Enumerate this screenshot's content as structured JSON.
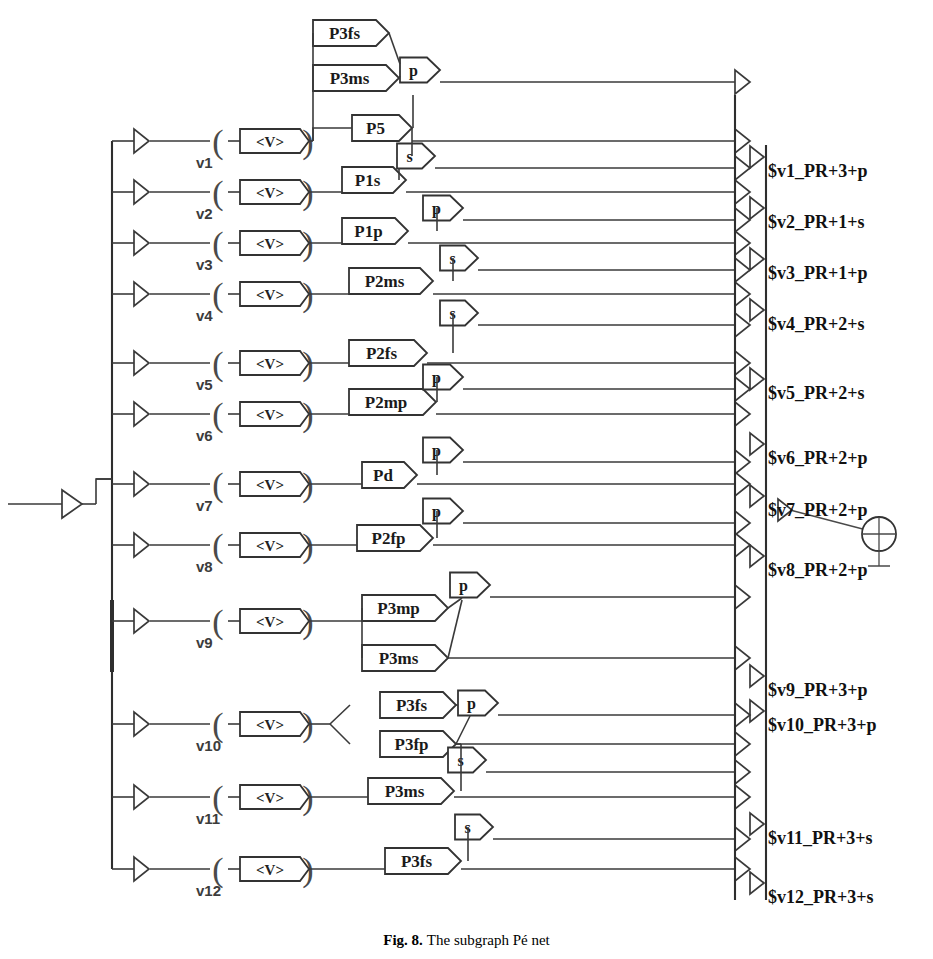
{
  "figure": {
    "caption_label": "Fig. 8.",
    "caption_text": "The subgraph Pé net",
    "value_box_label": "<V>"
  },
  "left_branches": [
    {
      "id": "v1",
      "label": "v1",
      "y": 141
    },
    {
      "id": "v2",
      "label": "v2",
      "y": 192
    },
    {
      "id": "v3",
      "label": "v3",
      "y": 243
    },
    {
      "id": "v4",
      "label": "v4",
      "y": 294
    },
    {
      "id": "v5",
      "label": "v5",
      "y": 363
    },
    {
      "id": "v6",
      "label": "v6",
      "y": 414
    },
    {
      "id": "v7",
      "label": "v7",
      "y": 484
    },
    {
      "id": "v8",
      "label": "v8",
      "y": 545
    },
    {
      "id": "v9",
      "label": "v9",
      "y": 621
    },
    {
      "id": "v10",
      "label": "v10",
      "y": 724
    },
    {
      "id": "v11",
      "label": "v11",
      "y": 797
    },
    {
      "id": "v12",
      "label": "v12",
      "y": 869
    }
  ],
  "place_boxes": [
    {
      "id": "p3fs_a",
      "label": "P3fs",
      "x": 313,
      "y": 33,
      "w": 63
    },
    {
      "id": "p3ms_a",
      "label": "P3ms",
      "x": 313,
      "y": 78,
      "w": 73
    },
    {
      "id": "p5",
      "label": "P5",
      "x": 352,
      "y": 128,
      "w": 47
    },
    {
      "id": "p1s",
      "label": "P1s",
      "x": 342,
      "y": 180,
      "w": 51
    },
    {
      "id": "p1p",
      "label": "P1p",
      "x": 342,
      "y": 231,
      "w": 53
    },
    {
      "id": "p2ms",
      "label": "P2ms",
      "x": 349,
      "y": 281,
      "w": 71
    },
    {
      "id": "p2fs",
      "label": "P2fs",
      "x": 349,
      "y": 353,
      "w": 65
    },
    {
      "id": "p2mp",
      "label": "P2mp",
      "x": 349,
      "y": 402,
      "w": 74
    },
    {
      "id": "pd",
      "label": "Pd",
      "x": 362,
      "y": 475,
      "w": 42
    },
    {
      "id": "p2fp",
      "label": "P2fp",
      "x": 357,
      "y": 538,
      "w": 63
    },
    {
      "id": "p3mp",
      "label": "P3mp",
      "x": 362,
      "y": 608,
      "w": 73
    },
    {
      "id": "p3ms_b",
      "label": "P3ms",
      "x": 362,
      "y": 658,
      "w": 73
    },
    {
      "id": "p3fs_b",
      "label": "P3fs",
      "x": 380,
      "y": 705,
      "w": 63
    },
    {
      "id": "p3fp",
      "label": "P3fp",
      "x": 380,
      "y": 744,
      "w": 63
    },
    {
      "id": "p3ms_c",
      "label": "P3ms",
      "x": 368,
      "y": 791,
      "w": 73
    },
    {
      "id": "p3fs_c",
      "label": "P3fs",
      "x": 385,
      "y": 861,
      "w": 63
    }
  ],
  "transition_boxes": [
    {
      "id": "t1",
      "label": "p",
      "x": 400,
      "y": 70,
      "w": 27
    },
    {
      "id": "t2",
      "label": "s",
      "x": 397,
      "y": 156,
      "w": 25
    },
    {
      "id": "t3",
      "label": "p",
      "x": 423,
      "y": 208,
      "w": 27
    },
    {
      "id": "t4",
      "label": "s",
      "x": 440,
      "y": 258,
      "w": 25
    },
    {
      "id": "t5",
      "label": "s",
      "x": 440,
      "y": 313,
      "w": 25
    },
    {
      "id": "t6",
      "label": "p",
      "x": 423,
      "y": 377,
      "w": 27
    },
    {
      "id": "t7",
      "label": "p",
      "x": 423,
      "y": 450,
      "w": 27
    },
    {
      "id": "t8",
      "label": "p",
      "x": 423,
      "y": 511,
      "w": 27
    },
    {
      "id": "t9",
      "label": "p",
      "x": 450,
      "y": 585,
      "w": 27
    },
    {
      "id": "t10",
      "label": "p",
      "x": 458,
      "y": 703,
      "w": 27
    },
    {
      "id": "t11",
      "label": "s",
      "x": 448,
      "y": 760,
      "w": 25
    },
    {
      "id": "t12",
      "label": "s",
      "x": 455,
      "y": 827,
      "w": 25
    }
  ],
  "outputs": [
    {
      "id": "o1",
      "label": "$v1_PR+3+p",
      "y": 171
    },
    {
      "id": "o2",
      "label": "$v2_PR+1+s",
      "y": 222
    },
    {
      "id": "o3",
      "label": "$v3_PR+1+p",
      "y": 273
    },
    {
      "id": "o4",
      "label": "$v4_PR+2+s",
      "y": 324
    },
    {
      "id": "o5",
      "label": "$v5_PR+2+s",
      "y": 393
    },
    {
      "id": "o6",
      "label": "$v6_PR+2+p",
      "y": 458
    },
    {
      "id": "o7",
      "label": "$v7_PR+2+p",
      "y": 510
    },
    {
      "id": "o8",
      "label": "$v8_PR+2+p",
      "y": 570
    },
    {
      "id": "o9",
      "label": "$v9_PR+3+p",
      "y": 690
    },
    {
      "id": "o10",
      "label": "$v10_PR+3+p",
      "y": 725
    },
    {
      "id": "o11",
      "label": "$v11_PR+3+s",
      "y": 838
    },
    {
      "id": "o12",
      "label": "$v12_PR+3+s",
      "y": 897
    }
  ],
  "terminator": {
    "id": "ground-symbol",
    "name": "crossed-circle",
    "x": 879,
    "y": 533
  }
}
